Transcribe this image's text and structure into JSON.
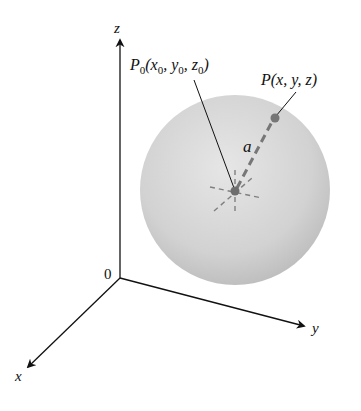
{
  "figure": {
    "type": "3d-sphere-diagram",
    "axes": {
      "z_label": "z",
      "y_label": "y",
      "x_label": "x",
      "origin_label": "0"
    },
    "center_point": {
      "label_P": "P",
      "label_sub": "0",
      "label_args": "(x",
      "label_x_sub": "0",
      "label_comma1": ", y",
      "label_y_sub": "0",
      "label_comma2": ", z",
      "label_z_sub": "0",
      "label_close": ")"
    },
    "surface_point": {
      "label": "P(x, y, z)"
    },
    "radius_label": "a",
    "colors": {
      "axis": "#111111",
      "sphere_light": "#e4e4e4",
      "sphere_dark": "#b9b9b9",
      "point": "#707070",
      "dashed": "#808080"
    }
  }
}
